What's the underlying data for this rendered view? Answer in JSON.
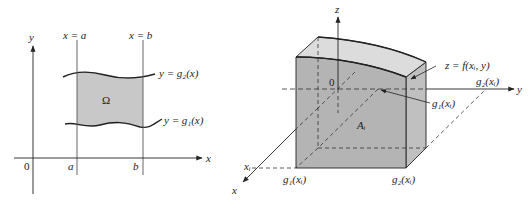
{
  "left_figure": {
    "axis_labels": {
      "x": "x",
      "y": "y",
      "origin": "0"
    },
    "tick_labels": {
      "a": "a",
      "b": "b"
    },
    "vertical_lines": {
      "left": "x = a",
      "right": "x = b"
    },
    "curves": {
      "upper": "y = g₂(x)",
      "lower": "y = g₁(x)"
    },
    "region_label": "Ω",
    "colors": {
      "region_fill": "#c8c8c8",
      "line": "#222222"
    }
  },
  "right_figure": {
    "axis_labels": {
      "x": "x",
      "y": "y",
      "z": "z",
      "origin": "0"
    },
    "surface_label": "z = f(xᵢ, y)",
    "cross_section_label": "Aᵢ",
    "point_labels": {
      "xi": "xᵢ",
      "g1_on_axis": "g₁(xᵢ)",
      "g2_on_axis": "g₂(xᵢ)",
      "g1_bottom": "g₁(xᵢ)",
      "g2_bottom": "g₂(xᵢ)"
    },
    "colors": {
      "front_face": "#b0b0b0",
      "top_face": "#d8d8d8",
      "side_face": "#c0c0c0",
      "line": "#222222"
    }
  }
}
